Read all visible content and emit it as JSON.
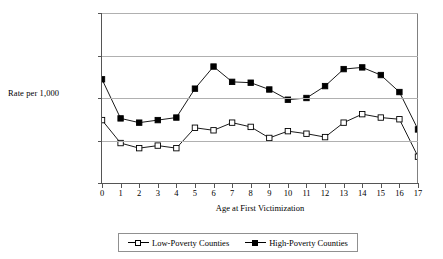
{
  "chart_data": {
    "type": "line",
    "title": "",
    "xlabel": "Age at First Victimization",
    "ylabel": "Rate per 1,000",
    "x": [
      0,
      1,
      2,
      3,
      4,
      5,
      6,
      7,
      8,
      9,
      10,
      11,
      12,
      13,
      14,
      15,
      16,
      17
    ],
    "xticklabels": [
      "0",
      "1",
      "2",
      "3",
      "4",
      "5",
      "6",
      "7",
      "8",
      "9",
      "10",
      "11",
      "12",
      "13",
      "14",
      "15",
      "16",
      "17"
    ],
    "yticklabels": [
      "0.0",
      "0.5",
      "1.0",
      "1.5",
      "2.0"
    ],
    "yticks": [
      0.0,
      0.5,
      1.0,
      1.5,
      2.0
    ],
    "ylim": [
      0.0,
      2.0
    ],
    "xlim": [
      0,
      17
    ],
    "grid": "horizontal",
    "legend_position": "bottom-center",
    "series": [
      {
        "name": "Low-Poverty Counties",
        "marker": "open-square",
        "color": "#000000",
        "values": [
          0.74,
          0.47,
          0.41,
          0.44,
          0.41,
          0.65,
          0.62,
          0.71,
          0.66,
          0.53,
          0.61,
          0.58,
          0.54,
          0.71,
          0.81,
          0.77,
          0.75,
          0.31
        ]
      },
      {
        "name": "High-Poverty Counties",
        "marker": "filled-square",
        "color": "#000000",
        "values": [
          1.22,
          0.76,
          0.71,
          0.74,
          0.77,
          1.11,
          1.37,
          1.19,
          1.18,
          1.1,
          0.98,
          1.0,
          1.14,
          1.34,
          1.36,
          1.27,
          1.07,
          0.63
        ]
      }
    ]
  },
  "legend": {
    "entries": [
      {
        "label": "Low-Poverty Counties"
      },
      {
        "label": "High-Poverty Counties"
      }
    ]
  }
}
